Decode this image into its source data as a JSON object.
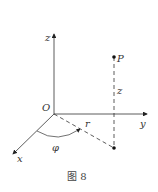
{
  "labels": {
    "z_axis": "z",
    "y_axis": "y",
    "x_axis": "x",
    "origin": "O",
    "point": "P",
    "height": "z",
    "radius": "r",
    "angle": "φ"
  },
  "caption": "图 8"
}
